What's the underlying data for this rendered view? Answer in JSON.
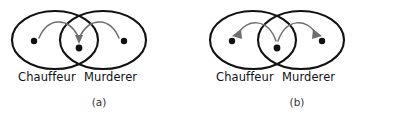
{
  "figure": {
    "background_color": "#ffffff",
    "ellipse_stroke_color": "#111111",
    "arrow_color": "#6f6f6f",
    "dot_color": "#111111"
  },
  "panels": [
    {
      "id": "a",
      "caption": "(a)",
      "left_set_label": "Chauffeur",
      "right_set_label": "Murderer",
      "arrow_direction": "inward",
      "dots": [
        {
          "name": "left-outer-dot",
          "cx": 34,
          "cy": 41
        },
        {
          "name": "center-dot",
          "cx": 79,
          "cy": 48
        },
        {
          "name": "right-outer-dot",
          "cx": 124,
          "cy": 41
        }
      ],
      "ellipses": [
        {
          "name": "chauffeur-ellipse",
          "cx": 55,
          "cy": 40,
          "rx": 43,
          "ry": 29
        },
        {
          "name": "murderer-ellipse",
          "cx": 103,
          "cy": 40,
          "rx": 43,
          "ry": 29
        }
      ]
    },
    {
      "id": "b",
      "caption": "(b)",
      "left_set_label": "Chauffeur",
      "right_set_label": "Murderer",
      "arrow_direction": "outward",
      "dots": [
        {
          "name": "left-outer-dot",
          "cx": 34,
          "cy": 41
        },
        {
          "name": "center-dot",
          "cx": 79,
          "cy": 48
        },
        {
          "name": "right-outer-dot",
          "cx": 124,
          "cy": 41
        }
      ],
      "ellipses": [
        {
          "name": "chauffeur-ellipse",
          "cx": 55,
          "cy": 40,
          "rx": 43,
          "ry": 29
        },
        {
          "name": "murderer-ellipse",
          "cx": 103,
          "cy": 40,
          "rx": 43,
          "ry": 29
        }
      ]
    }
  ]
}
